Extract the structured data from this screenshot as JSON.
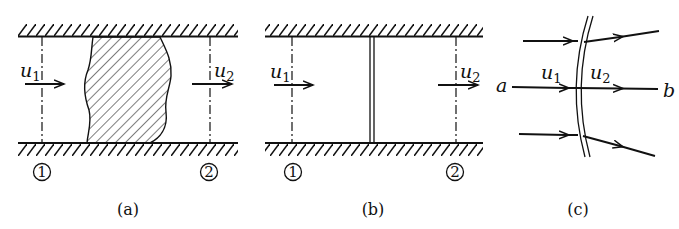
{
  "diagram": {
    "type": "fluid-flow-control-volume-figure",
    "panels": [
      {
        "id": "a",
        "caption": "(a)",
        "description": "Duct with shaded irregular region between sections 1 and 2",
        "inlet_velocity": "u",
        "inlet_sub": "1",
        "outlet_velocity": "u",
        "outlet_sub": "2",
        "section_1": "1",
        "section_2": "2"
      },
      {
        "id": "b",
        "caption": "(b)",
        "description": "Duct with thin discontinuity (shock) between sections 1 and 2",
        "inlet_velocity": "u",
        "inlet_sub": "1",
        "outlet_velocity": "u",
        "outlet_sub": "2",
        "section_1": "1",
        "section_2": "2"
      },
      {
        "id": "c",
        "caption": "(c)",
        "description": "Curved discontinuity with streamlines crossing it",
        "inlet_velocity": "u",
        "inlet_sub": "1",
        "outlet_velocity": "u",
        "outlet_sub": "2",
        "point_a": "a",
        "point_b": "b"
      }
    ],
    "colors": {
      "ink": "#111111",
      "background": "#ffffff"
    }
  }
}
